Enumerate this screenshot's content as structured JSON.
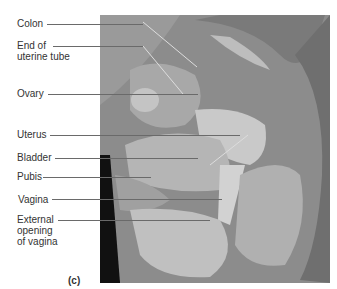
{
  "figure": {
    "panel_label": "(c)",
    "labels": [
      {
        "id": "colon",
        "lines": [
          "Colon"
        ]
      },
      {
        "id": "end-of-uterine-tube",
        "lines": [
          "End of",
          "uterine tube"
        ]
      },
      {
        "id": "ovary",
        "lines": [
          "Ovary"
        ]
      },
      {
        "id": "uterus",
        "lines": [
          "Uterus"
        ]
      },
      {
        "id": "bladder",
        "lines": [
          "Bladder"
        ]
      },
      {
        "id": "pubis",
        "lines": [
          "Pubis"
        ]
      },
      {
        "id": "vagina",
        "lines": [
          "Vagina"
        ]
      },
      {
        "id": "external-opening-of-vagina",
        "lines": [
          "External",
          "opening",
          "of vagina"
        ]
      }
    ]
  }
}
